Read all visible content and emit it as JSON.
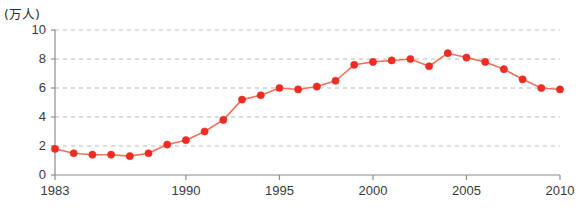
{
  "chart_data": {
    "type": "line",
    "title": "",
    "subtitle": "",
    "xlabel": "",
    "ylabel": "(万人)",
    "unit_label": "(万人)",
    "x": [
      1983,
      1984,
      1985,
      1986,
      1987,
      1988,
      1989,
      1990,
      1991,
      1992,
      1993,
      1994,
      1995,
      1996,
      1997,
      1998,
      1999,
      2000,
      2001,
      2002,
      2003,
      2004,
      2005,
      2006,
      2007,
      2008,
      2009,
      2010
    ],
    "values": [
      1.8,
      1.5,
      1.4,
      1.4,
      1.3,
      1.5,
      2.1,
      2.4,
      3.0,
      3.8,
      5.2,
      5.5,
      6.0,
      5.9,
      6.1,
      6.5,
      7.6,
      7.8,
      7.9,
      8.0,
      7.5,
      8.4,
      8.1,
      7.8,
      7.3,
      6.6,
      6.0,
      5.9
    ],
    "series": [
      {
        "name": "",
        "color": "#ef2b23",
        "values": [
          1.8,
          1.5,
          1.4,
          1.4,
          1.3,
          1.5,
          2.1,
          2.4,
          3.0,
          3.8,
          5.2,
          5.5,
          6.0,
          5.9,
          6.1,
          6.5,
          7.6,
          7.8,
          7.9,
          8.0,
          7.5,
          8.4,
          8.1,
          7.8,
          7.3,
          6.6,
          6.0,
          5.9
        ]
      }
    ],
    "ylim": [
      0,
      10
    ],
    "xlim": [
      1983,
      2010
    ],
    "yticks": [
      0,
      2,
      4,
      6,
      8,
      10
    ],
    "ytick_labels": [
      "0",
      "2",
      "4",
      "6",
      "8",
      "10"
    ],
    "xticks": [
      1983,
      1990,
      1995,
      2000,
      2005,
      2010
    ],
    "xtick_labels": [
      "1983",
      "1990",
      "1995",
      "2000",
      "2005",
      "2010"
    ],
    "grid": "horizontal-dashed",
    "legend": "none",
    "marker": "circle",
    "marker_color": "#ef2b23",
    "line_color": "#f2715c",
    "axis_color": "#8c8c8c",
    "grid_color": "#b9b9b9"
  }
}
